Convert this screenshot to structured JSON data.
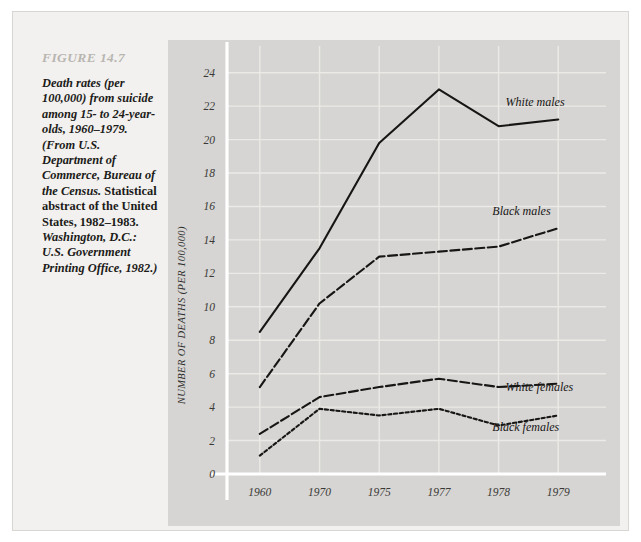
{
  "figure": {
    "number_label": "FIGURE 14.7",
    "caption_segments": [
      {
        "style": "italic",
        "text": "Death rates (per 100,000) from suicide among 15- to 24-year-olds, 1960–1979. (From U.S. Department of Commerce, Bureau of the Census. "
      },
      {
        "style": "roman",
        "text": "Statistical abstract of the United States, 1982–1983. "
      },
      {
        "style": "italic",
        "text": "Washington, D.C.: U.S. Government Printing Office, 1982.)"
      }
    ],
    "caption_plain": "Death rates (per 100,000) from suicide among 15- to 24-year-olds, 1960-1979. (From U.S. Department of Commerce, Bureau of the Census. Statistical abstract of the United States, 1982-1983. Washington, D.C.: U.S. Government Printing Office, 1982.)"
  },
  "chart_data": {
    "type": "line",
    "title": "",
    "xlabel": "",
    "ylabel": "NUMBER OF DEATHS (PER 100,000)",
    "categories": [
      "1960",
      "1970",
      "1975",
      "1977",
      "1978",
      "1979"
    ],
    "yticks": [
      0,
      2,
      4,
      6,
      8,
      10,
      12,
      14,
      16,
      18,
      20,
      22,
      24
    ],
    "ylim": [
      0,
      25
    ],
    "grid": true,
    "legend_position": "inline-annotations",
    "series": [
      {
        "name": "White males",
        "line_style": "solid",
        "color": "#17161400",
        "values": [
          8.5,
          13.5,
          19.8,
          23.0,
          20.8,
          21.2
        ],
        "label_x_category": "1978",
        "label_offset": "above-right"
      },
      {
        "name": "Black males",
        "line_style": "dashed",
        "values": [
          5.2,
          10.2,
          13.0,
          13.3,
          13.6,
          14.7
        ],
        "label_x_category": "1978",
        "label_offset": "above"
      },
      {
        "name": "White females",
        "line_style": "dashed",
        "values": [
          2.4,
          4.6,
          5.2,
          5.7,
          5.2,
          5.4
        ],
        "label_x_category": "1978",
        "label_offset": "below"
      },
      {
        "name": "Black females",
        "line_style": "dotted",
        "values": [
          1.1,
          3.9,
          3.5,
          3.9,
          2.9,
          3.5
        ],
        "label_x_category": "1978",
        "label_offset": "below"
      }
    ]
  },
  "colors": {
    "page_background": "#ffffff",
    "figure_background": "#f2f1ef",
    "plot_background": "#d6d5d3",
    "grid_line": "#eceae6",
    "axis_line": "#ffffff",
    "line_color": "#171614",
    "figure_number_color": "#b9b6b1",
    "caption_color": "#1c1b19"
  }
}
